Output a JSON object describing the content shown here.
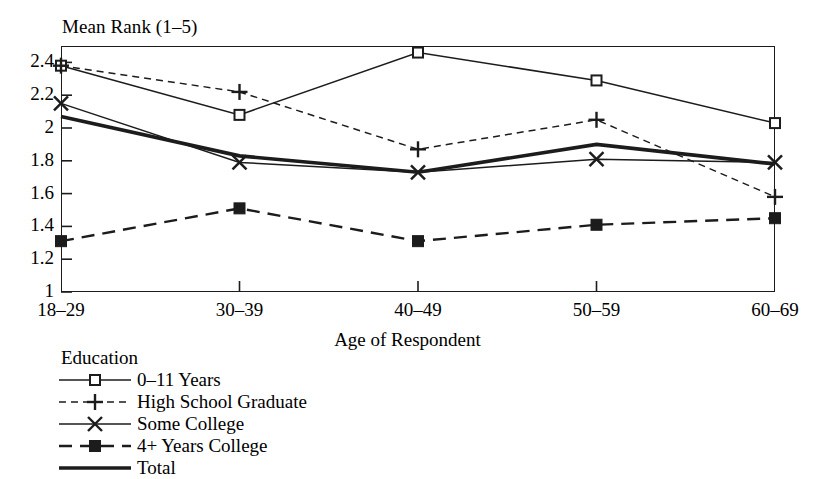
{
  "figure": {
    "clipped_top_title": "",
    "y_axis_title": "Mean Rank (1–5)",
    "x_axis_title": "Age of Respondent",
    "legend_title": "Education",
    "ink_color": "#1c1c1c"
  },
  "chart_data": {
    "type": "line",
    "title": "",
    "xlabel": "Age of Respondent",
    "ylabel": "Mean Rank (1–5)",
    "categories": [
      "18–29",
      "30–39",
      "40–49",
      "50–59",
      "60–69"
    ],
    "ylim": [
      1,
      2.5
    ],
    "yticks": [
      "1",
      "1.2",
      "1.4",
      "1.6",
      "1.8",
      "2",
      "2.2",
      "2.4"
    ],
    "ytick_values": [
      1,
      1.2,
      1.4,
      1.6,
      1.8,
      2,
      2.2,
      2.4
    ],
    "grid": false,
    "legend_position": "below-left",
    "series": [
      {
        "name": "0–11 Years",
        "marker": "open-square",
        "line_style": "solid",
        "line_width": "thin",
        "values": [
          2.38,
          2.08,
          2.46,
          2.29,
          2.03
        ]
      },
      {
        "name": "High School Graduate",
        "marker": "plus",
        "line_style": "dashed-short",
        "line_width": "thin",
        "values": [
          2.38,
          2.22,
          1.87,
          2.05,
          1.58
        ]
      },
      {
        "name": "Some College",
        "marker": "cross",
        "line_style": "solid",
        "line_width": "thin",
        "values": [
          2.15,
          1.79,
          1.73,
          1.81,
          1.79
        ]
      },
      {
        "name": "4+ Years College",
        "marker": "filled-square",
        "line_style": "dashed-long",
        "line_width": "medium",
        "values": [
          1.31,
          1.51,
          1.31,
          1.41,
          1.45
        ]
      },
      {
        "name": "Total",
        "marker": "none",
        "line_style": "solid",
        "line_width": "thick",
        "values": [
          2.07,
          1.83,
          1.73,
          1.9,
          1.78
        ]
      }
    ]
  }
}
